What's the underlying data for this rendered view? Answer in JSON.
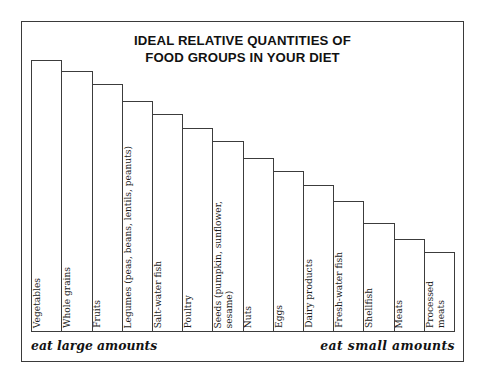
{
  "figure": {
    "title_lines": [
      "IDEAL RELATIVE QUANTITIES OF",
      "FOOD GROUPS IN YOUR DIET"
    ],
    "footer_left": "eat large amounts",
    "footer_right": "eat small amounts",
    "frame_color": "#3a3a3a",
    "bar_outline_color": "#3c3c3c",
    "bar_fill_color": "#ffffff",
    "background_color": "#ffffff"
  },
  "chart_data": {
    "type": "bar",
    "title": "IDEAL RELATIVE QUANTITIES OF FOOD GROUPS IN YOUR DIET",
    "xlabel": "",
    "ylabel": "",
    "ylim": [
      0,
      100
    ],
    "grid": false,
    "legend": false,
    "orientation": "vertical",
    "note_left": "eat large amounts",
    "note_right": "eat small amounts",
    "categories": [
      "Vegetables",
      "Whole grains",
      "Fruits",
      "Legumes (peas, beans, lentils, peanuts)",
      "Salt-water fish",
      "Poultry",
      "Seeds (pumpkin, sunflower, sesame)",
      "Nuts",
      "Eggs",
      "Dairy products",
      "Fresh-water fish",
      "Shellfish",
      "Meats",
      "Processed meats"
    ],
    "values": [
      100,
      96,
      91,
      85,
      80,
      75,
      70,
      64,
      59,
      54,
      48,
      40,
      34,
      29
    ]
  },
  "bars": [
    {
      "label_lines": [
        "Vegetables"
      ],
      "value": 100
    },
    {
      "label_lines": [
        "Whole grains"
      ],
      "value": 96
    },
    {
      "label_lines": [
        "Fruits"
      ],
      "value": 91
    },
    {
      "label_lines": [
        "Legumes (peas, beans, lentils, peanuts)"
      ],
      "value": 85
    },
    {
      "label_lines": [
        "Salt-water fish"
      ],
      "value": 80
    },
    {
      "label_lines": [
        "Poultry"
      ],
      "value": 75
    },
    {
      "label_lines": [
        "Seeds (pumpkin, sunflower,",
        "sesame)"
      ],
      "value": 70
    },
    {
      "label_lines": [
        "Nuts"
      ],
      "value": 64
    },
    {
      "label_lines": [
        "Eggs"
      ],
      "value": 59
    },
    {
      "label_lines": [
        "Dairy products"
      ],
      "value": 54
    },
    {
      "label_lines": [
        "Fresh-water fish"
      ],
      "value": 48
    },
    {
      "label_lines": [
        "Shellfish"
      ],
      "value": 40
    },
    {
      "label_lines": [
        "Meats"
      ],
      "value": 34
    },
    {
      "label_lines": [
        "Processed",
        "meats"
      ],
      "value": 29
    }
  ]
}
